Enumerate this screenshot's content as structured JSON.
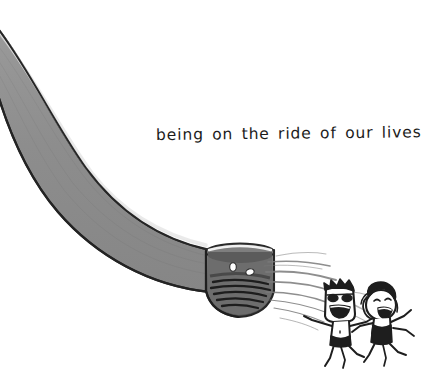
{
  "image": {
    "kind": "hand-drawn-cartoon-illustration",
    "width": 442,
    "height": 370,
    "background_color": "#ffffff"
  },
  "caption": {
    "text": "being on the ride of our lives",
    "color": "#1b1b1b",
    "style": "handwritten-lowercase"
  },
  "slide": {
    "name": "water-slide-chute",
    "body_color": "#8d8d8d",
    "outline_color": "#2a2a2a",
    "highlight_color": "#f2f2f2",
    "description": "wide curved grey flume sweeping from upper-left down to an open tube mouth at centre-right"
  },
  "tube_mouth": {
    "name": "slide-tube-opening",
    "interior_color": "#6f6f6f",
    "shadow_color": "#3a3a3a",
    "rim_highlight": "#ededed",
    "bubbles": [
      {
        "cx": 233,
        "cy": 267,
        "rx": 3.3,
        "ry": 4.3,
        "color": "#ffffff"
      },
      {
        "cx": 250,
        "cy": 272,
        "rx": 4.2,
        "ry": 3.2,
        "color": "#ffffff"
      }
    ]
  },
  "spray": {
    "name": "water-spray-streaks",
    "color": "#7d7d7d",
    "streak_count": 9
  },
  "figures": [
    {
      "name": "rider-with-sunglasses",
      "head_shape": "rectangular",
      "hair": "short-dark-spiky",
      "face": "sunglasses-and-wide-open-laughing-mouth",
      "swimwear": "dark-shorts",
      "ink_color": "#1e1e1e",
      "skin_color": "#ffffff"
    },
    {
      "name": "rider-with-long-hair",
      "head_shape": "round",
      "hair": "wavy-shoulder-length",
      "face": "closed-happy-eyes-and-open-laughing-mouth",
      "swimwear": "dark-swimsuit",
      "ink_color": "#1e1e1e",
      "skin_color": "#ffffff"
    }
  ]
}
